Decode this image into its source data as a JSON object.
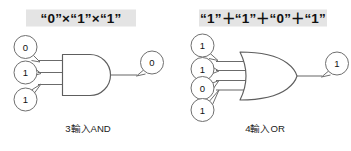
{
  "figure": {
    "background_color": "#ffffff",
    "line_color": "#6b6b6b",
    "highlight_color": "#e4e4e4",
    "text_color": "#111111"
  },
  "diagrams": [
    {
      "id": "and-gate",
      "title": "“0”×“1”×“1”",
      "caption": "3輸入AND",
      "gate_type": "AND",
      "input_count": 3,
      "inputs": [
        {
          "label": "0",
          "name": "and-input-0"
        },
        {
          "label": "1",
          "name": "and-input-1"
        },
        {
          "label": "1",
          "name": "and-input-2"
        }
      ],
      "output": {
        "label": "0",
        "name": "and-output"
      }
    },
    {
      "id": "or-gate",
      "title": "“1”＋“1”＋“0”＋“1”",
      "caption": "4輸入OR",
      "gate_type": "OR",
      "input_count": 4,
      "inputs": [
        {
          "label": "1",
          "name": "or-input-0"
        },
        {
          "label": "1",
          "name": "or-input-1"
        },
        {
          "label": "0",
          "name": "or-input-2"
        },
        {
          "label": "1",
          "name": "or-input-3"
        }
      ],
      "output": {
        "label": "1",
        "name": "or-output"
      }
    }
  ]
}
